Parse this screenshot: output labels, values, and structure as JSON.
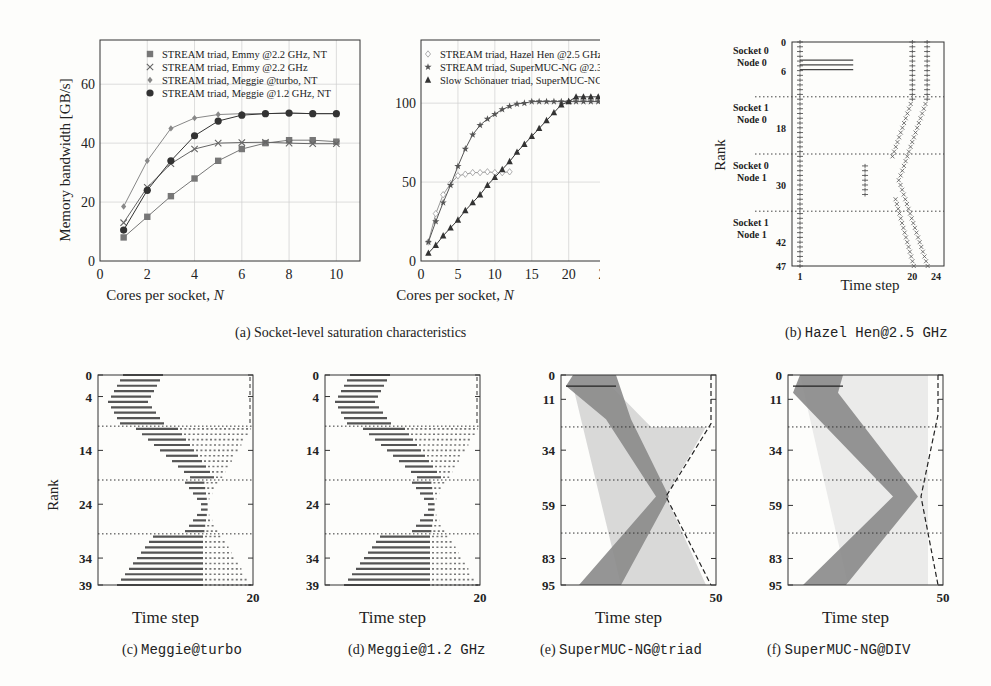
{
  "chart_data": [
    {
      "id": "a1",
      "type": "line",
      "xlabel": "Cores per socket, N",
      "ylabel": "Memory bandwidth [GB/s]",
      "xlim": [
        0,
        11
      ],
      "ylim": [
        0,
        75
      ],
      "xticks": [
        0,
        2,
        4,
        6,
        8,
        10
      ],
      "yticks": [
        0,
        20,
        40,
        60
      ],
      "grid": true,
      "legend_position": "top",
      "x": [
        1,
        2,
        3,
        4,
        5,
        6,
        7,
        8,
        9,
        10
      ],
      "series": [
        {
          "name": "STREAM triad, Emmy @2.2 GHz, NT",
          "marker": "square",
          "values": [
            8,
            15,
            22,
            28,
            34,
            38,
            40,
            41,
            41,
            40.5
          ]
        },
        {
          "name": "STREAM triad, Emmy @2.2 GHz",
          "marker": "x",
          "values": [
            13,
            25,
            33,
            38,
            40,
            40.2,
            40.3,
            40,
            39.8,
            39.8
          ]
        },
        {
          "name": "STREAM triad, Meggie @turbo, NT",
          "marker": "diamond",
          "values": [
            18.5,
            34,
            45,
            48.5,
            49.7,
            50,
            50,
            50.2,
            50,
            50
          ]
        },
        {
          "name": "STREAM triad, Meggie @1.2 GHz, NT",
          "marker": "circle",
          "values": [
            10.5,
            24,
            34,
            42.5,
            47.5,
            49.5,
            50,
            50.2,
            50,
            50
          ]
        }
      ]
    },
    {
      "id": "a2",
      "type": "line",
      "xlabel": "Cores per socket, N",
      "ylabel": "",
      "xlim": [
        0,
        26
      ],
      "ylim": [
        0,
        140
      ],
      "xticks": [
        0,
        5,
        10,
        15,
        20,
        25
      ],
      "yticks": [
        0,
        50,
        100
      ],
      "grid": true,
      "legend_position": "top",
      "series": [
        {
          "name": "STREAM triad, Hazel Hen @2.5 GHz, NT",
          "marker": "diamond-open",
          "x": [
            1,
            2,
            3,
            4,
            5,
            6,
            7,
            8,
            9,
            10,
            11,
            12
          ],
          "values": [
            12,
            30,
            42,
            49,
            54,
            55,
            56,
            56,
            56.5,
            56,
            56,
            56.5
          ]
        },
        {
          "name": "STREAM triad, SuperMUC-NG @2.3 GHz, NT",
          "marker": "star",
          "x": [
            1,
            2,
            3,
            4,
            5,
            6,
            7,
            8,
            9,
            10,
            11,
            12,
            13,
            14,
            15,
            16,
            17,
            18,
            19,
            20,
            21,
            22,
            23,
            24
          ],
          "values": [
            12,
            25,
            37,
            48,
            60,
            71,
            80,
            86,
            90,
            93,
            96,
            98,
            99.5,
            100,
            101,
            101,
            101,
            101,
            101,
            101,
            101,
            101,
            101,
            101
          ]
        },
        {
          "name": "Slow Schönauer triad, SuperMUC-NG @2.3 GHz, NT",
          "marker": "triangle",
          "x": [
            1,
            2,
            3,
            4,
            5,
            6,
            7,
            8,
            9,
            10,
            11,
            12,
            13,
            14,
            15,
            16,
            17,
            18,
            19,
            20,
            21,
            22,
            23,
            24
          ],
          "values": [
            5,
            10,
            16,
            21,
            26,
            32,
            37,
            42,
            48,
            53,
            58,
            63,
            69,
            74,
            79,
            84,
            89,
            94,
            99,
            101,
            104,
            104,
            104,
            104
          ]
        }
      ]
    },
    {
      "id": "b",
      "type": "scatter",
      "title": "Hazel Hen@2.5 GHz",
      "xlabel": "Time step",
      "ylabel": "Rank",
      "xticks": [
        1,
        20,
        24
      ],
      "yticks": [
        0,
        6,
        18,
        30,
        42,
        47
      ],
      "group_labels": [
        "Socket 0 Node 0",
        "Socket 1 Node 0",
        "Socket 0 Node 1",
        "Socket 1 Node 1"
      ]
    },
    {
      "id": "c",
      "type": "heatmap",
      "title": "Meggie@turbo",
      "xlabel": "Time step",
      "ylabel": "Rank",
      "xticks": [
        20
      ],
      "yticks": [
        0,
        4,
        14,
        24,
        34,
        39
      ]
    },
    {
      "id": "d",
      "type": "heatmap",
      "title": "Meggie@1.2 GHz",
      "xlabel": "Time step",
      "ylabel": "",
      "xticks": [
        20
      ],
      "yticks": [
        0,
        4,
        14,
        24,
        34,
        39
      ]
    },
    {
      "id": "e",
      "type": "heatmap",
      "title": "SuperMUC-NG@triad",
      "xlabel": "Time step",
      "ylabel": "",
      "xticks": [
        50
      ],
      "yticks": [
        0,
        11,
        34,
        59,
        83,
        95
      ]
    },
    {
      "id": "f",
      "type": "heatmap",
      "title": "SuperMUC-NG@DIV",
      "xlabel": "Time step",
      "ylabel": "",
      "xticks": [
        50
      ],
      "yticks": [
        0,
        11,
        34,
        59,
        83,
        95
      ]
    }
  ],
  "captions": {
    "a": {
      "prefix": "(a)",
      "text": "Socket-level saturation characteristics"
    },
    "b": {
      "prefix": "(b)",
      "text": "Hazel Hen@2.5 GHz"
    },
    "c": {
      "prefix": "(c)",
      "text": "Meggie@turbo"
    },
    "d": {
      "prefix": "(d)",
      "text": "Meggie@1.2 GHz"
    },
    "e": {
      "prefix": "(e)",
      "text": "SuperMUC-NG@triad"
    },
    "f": {
      "prefix": "(f)",
      "text": "SuperMUC-NG@DIV"
    }
  },
  "labels": {
    "cores_per_socket": "Cores per socket, ",
    "n": "N",
    "mem_bw": "Memory bandwidth [GB/s]",
    "rank": "Rank",
    "time_step": "Time step"
  }
}
